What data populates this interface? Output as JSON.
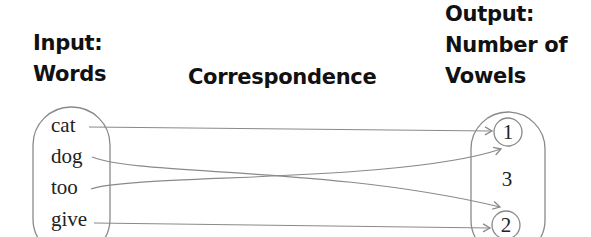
{
  "headings": {
    "input_line1": "Input:",
    "input_line2": "Words",
    "correspondence": "Correspondence",
    "output_line1": "Output:",
    "output_line2": "Number of",
    "output_line3": "Vowels"
  },
  "domain_set": {
    "label": "Input: Words",
    "items": [
      "cat",
      "dog",
      "too",
      "give"
    ]
  },
  "range_set": {
    "label": "Output: Number of Vowels",
    "items": [
      "1",
      "3",
      "2"
    ],
    "circled": [
      "1",
      "2"
    ]
  },
  "mappings": [
    {
      "from": "cat",
      "to": "1"
    },
    {
      "from": "dog",
      "to": "2"
    },
    {
      "from": "too",
      "to": "1"
    },
    {
      "from": "give",
      "to": "2"
    }
  ],
  "colors": {
    "text": "#111111",
    "line": "#8a8a8a",
    "background": "#ffffff"
  }
}
